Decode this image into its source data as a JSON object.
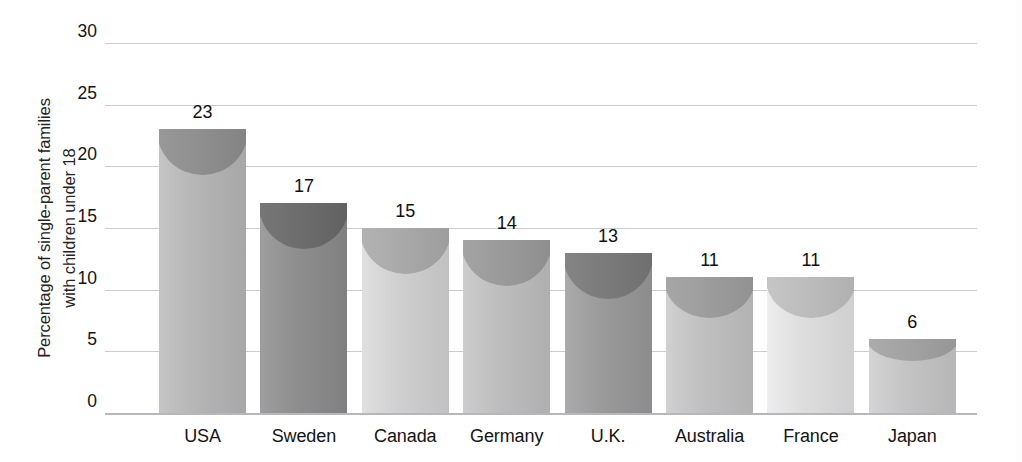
{
  "chart_data": {
    "type": "bar",
    "title": "",
    "xlabel": "",
    "ylabel": "Percentage of single-parent families with children under 18",
    "ylabel_lines": [
      "Percentage of single-parent families",
      "with children under 18"
    ],
    "categories": [
      "USA",
      "Sweden",
      "Canada",
      "Germany",
      "U.K.",
      "Australia",
      "France",
      "Japan"
    ],
    "values": [
      23,
      17,
      15,
      14,
      13,
      11,
      11,
      6
    ],
    "value_labels": [
      "23",
      "17",
      "15",
      "14",
      "13",
      "11",
      "11",
      "6"
    ],
    "ylim": [
      0,
      30
    ],
    "yticks": [
      0,
      5,
      10,
      15,
      20,
      25,
      30
    ],
    "ytick_labels": [
      "0",
      "5",
      "10",
      "15",
      "20",
      "25",
      "30"
    ],
    "grid": true,
    "grid_axis": "y",
    "legend": false,
    "legend_position": "none",
    "bar_colors": [
      "#b5b5b5",
      "#8e8e8e",
      "#cfcfcf",
      "#bdbdbd",
      "#9a9a9a",
      "#c0c0c0",
      "#dddddd",
      "#c4c4c4"
    ],
    "bar_cap_colors": [
      "#8f8f8f",
      "#6d6d6d",
      "#a9a9a9",
      "#9a9a9a",
      "#7b7b7b",
      "#9d9d9d",
      "#bcbcbc",
      "#a2a2a2"
    ]
  },
  "axis": {
    "grid_color": "#c9cdd1",
    "baseline_color": "#b4b8bc",
    "text_color": "#141414"
  }
}
